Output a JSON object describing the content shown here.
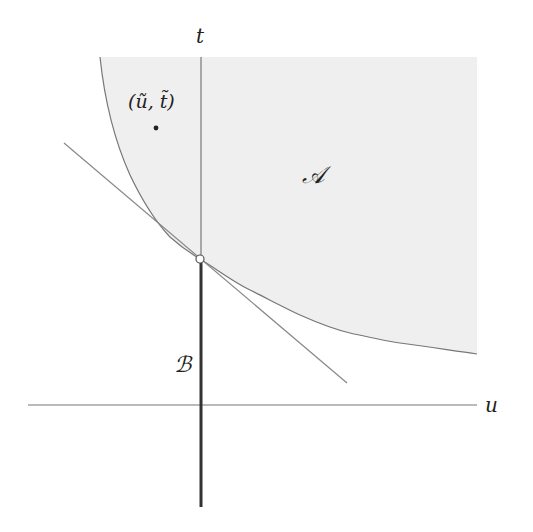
{
  "diagram": {
    "axes": {
      "horizontal_label": "u",
      "vertical_label": "t"
    },
    "regions": {
      "region_a_label": "𝒜",
      "region_b_label": "ℬ"
    },
    "point": {
      "label": "(ũ, t̃)"
    },
    "colors": {
      "shade": "#efefef",
      "line": "#777777",
      "thick_line": "#333333",
      "text": "#222222"
    }
  }
}
